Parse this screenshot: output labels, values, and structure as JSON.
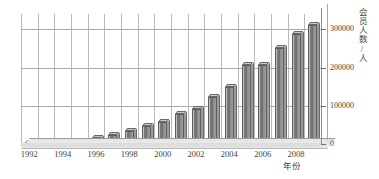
{
  "chart_data": {
    "type": "bar",
    "title": "",
    "subtitle": "",
    "xlabel": "年份",
    "ylabel": "会员人数/人",
    "categories": [
      "1992",
      "1993",
      "1994",
      "1995",
      "1996",
      "1997",
      "1998",
      "1999",
      "2000",
      "2001",
      "2002",
      "2003",
      "2004",
      "2005",
      "2006",
      "2007",
      "2008",
      "2009"
    ],
    "values": [
      1500,
      2000,
      3000,
      6000,
      17000,
      23000,
      33000,
      48000,
      58000,
      78000,
      92000,
      122000,
      148000,
      207000,
      207000,
      250000,
      288000,
      310000
    ],
    "x_tick_labels": [
      "1992",
      "1994",
      "1996",
      "1998",
      "2000",
      "2002",
      "2004",
      "2006",
      "2008"
    ],
    "x_tick_indices": [
      0,
      2,
      4,
      6,
      8,
      10,
      12,
      14,
      16
    ],
    "y_tick_labels": [
      "0",
      "100000",
      "200000",
      "300000"
    ],
    "y_tick_values": [
      0,
      100000,
      200000,
      300000
    ],
    "ylim": [
      0,
      340000
    ],
    "y_axis_position": "right",
    "grid": true,
    "grid_horizontal": true,
    "grid_vertical": true,
    "legend": false,
    "legend_position": "none",
    "style_3d": true,
    "series": [
      {
        "name": "会员人数",
        "values": [
          1500,
          2000,
          3000,
          6000,
          17000,
          23000,
          33000,
          48000,
          58000,
          78000,
          92000,
          122000,
          148000,
          207000,
          207000,
          250000,
          288000,
          310000
        ]
      }
    ]
  },
  "colors": {
    "bar_face": "#6f6f6f",
    "bar_top": "#c9c9c9",
    "bar_side": "#9a9a9a",
    "bar_outline": "#5d5d5d",
    "grid": "#b9b9b9",
    "axis": "#8a8a8a",
    "floor": "#e7e7e7",
    "text": "#3f3f3f",
    "background": "#ffffff"
  }
}
